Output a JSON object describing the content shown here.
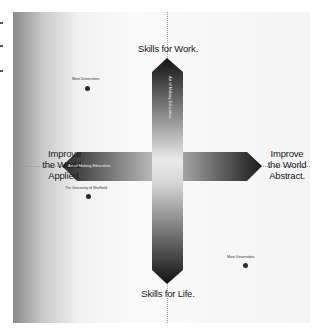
{
  "diagram": {
    "poles": {
      "top": [
        "Skills for Work."
      ],
      "bottom": [
        "Skills for Life."
      ],
      "left": [
        "Improve",
        "the World",
        "Applied."
      ],
      "right": [
        "Improve",
        "the World",
        "Abstract."
      ]
    },
    "arm_labels": {
      "left": "Art of Making Education",
      "top": "Art of Making Education"
    },
    "points": [
      {
        "label": "Most Universities",
        "quadrant": "top-left"
      },
      {
        "label": "The University of Sheffield",
        "quadrant": "bottom-left"
      },
      {
        "label": "Most Universities",
        "quadrant": "bottom-right"
      }
    ],
    "colors": {
      "arrow_dark": "#1a1a1a",
      "arrow_light": "#e6e6e6",
      "frame_left": "#8a8a8a",
      "frame_bg": "#f4f4f4",
      "dot": "#2a2a2a"
    }
  }
}
